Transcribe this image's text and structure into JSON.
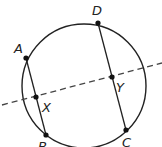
{
  "diagram": {
    "type": "circle with two chords and a dashed secant line",
    "circle": {
      "cx": 84,
      "cy": 86,
      "r": 62
    },
    "points": [
      {
        "id": "A",
        "label": "A",
        "x": 26,
        "y": 58,
        "lx": 14,
        "ly": 53
      },
      {
        "id": "B",
        "label": "B",
        "x": 46,
        "y": 135,
        "lx": 38,
        "ly": 150
      },
      {
        "id": "C",
        "label": "C",
        "x": 126,
        "y": 130,
        "lx": 124,
        "ly": 146
      },
      {
        "id": "D",
        "label": "D",
        "x": 98,
        "y": 23,
        "lx": 92,
        "ly": 17
      },
      {
        "id": "X",
        "label": "X",
        "x": 36,
        "y": 97,
        "lx": 42,
        "ly": 111
      },
      {
        "id": "Y",
        "label": "Y",
        "x": 112,
        "y": 77,
        "lx": 116,
        "ly": 93
      }
    ],
    "chords": [
      {
        "name": "AB",
        "from": "A",
        "to": "B"
      },
      {
        "name": "DC",
        "from": "D",
        "to": "C"
      }
    ],
    "dashed_line": {
      "x1": 2,
      "y1": 105,
      "x2": 162,
      "y2": 63,
      "through": [
        "X",
        "Y"
      ]
    },
    "colors": {
      "stroke": "#222222",
      "background": "#ffffff"
    }
  }
}
